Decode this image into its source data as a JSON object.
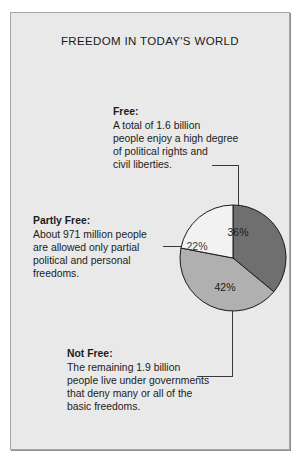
{
  "title": "FREEDOM IN TODAY'S WORLD",
  "callouts": {
    "free": {
      "heading": "Free:",
      "lines": [
        "A total of 1.6 billion",
        "people enjoy a high degree",
        "of political rights and",
        "civil liberties."
      ]
    },
    "partly_free": {
      "heading": "Partly Free:",
      "lines": [
        "About 971 million people",
        "are allowed only partial",
        "political and personal",
        "freedoms."
      ]
    },
    "not_free": {
      "heading": "Not Free:",
      "lines": [
        "The remaining 1.9 billion",
        "people live under governments",
        "that deny many or all of the",
        "basic freedoms."
      ]
    }
  },
  "chart_data": {
    "type": "pie",
    "title": "FREEDOM IN TODAY'S WORLD",
    "categories": [
      "Free",
      "Not Free",
      "Partly Free"
    ],
    "values": [
      36,
      42,
      22
    ],
    "unit": "%",
    "labels": [
      "36%",
      "42%",
      "22%"
    ],
    "colors": [
      "#6f6f6f",
      "#b0b0b0",
      "#f2f2f2"
    ],
    "stroke": "#1a1a1a",
    "legend": "none",
    "start_angle_deg": 0,
    "direction": "clockwise",
    "population": {
      "free": "1.6 billion",
      "partly_free": "971 million",
      "not_free": "1.9 billion"
    }
  },
  "slice_labels": {
    "free": "36%",
    "not_free": "42%",
    "partly_free": "22%"
  },
  "colors": {
    "panel_bg": "#e9e9e9",
    "panel_border": "#a7a7a7",
    "text": "#1c1c1c",
    "leader": "#3a3a3a"
  }
}
